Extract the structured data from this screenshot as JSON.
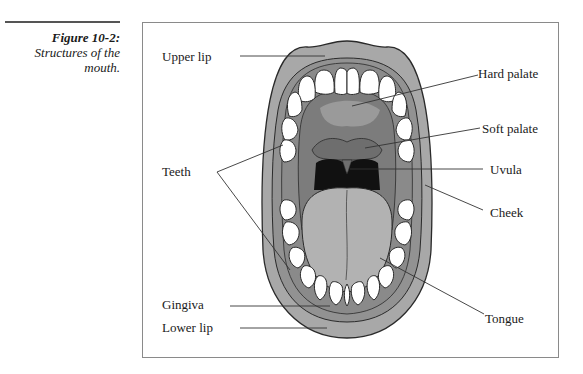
{
  "caption": {
    "figure_number": "Figure 10-2:",
    "title_line1": "Structures of the",
    "title_line2": "mouth."
  },
  "diagram": {
    "subject": "Structures of the mouth",
    "labels": {
      "upper_lip": "Upper lip",
      "hard_palate": "Hard palate",
      "soft_palate": "Soft palate",
      "teeth": "Teeth",
      "uvula": "Uvula",
      "cheek": "Cheek",
      "gingiva": "Gingiva",
      "lower_lip": "Lower lip",
      "tongue": "Tongue"
    },
    "colors": {
      "lip": "#a8a8a8",
      "gum": "#8c8c8c",
      "palate": "#7c7c7c",
      "tongue": "#b2b2b2",
      "throat": "#111111",
      "tooth": "#ffffff",
      "outline": "#2a2a2a",
      "frame": "#8a8a8a"
    }
  }
}
